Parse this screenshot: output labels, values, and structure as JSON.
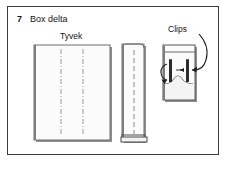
{
  "figure": {
    "step_number": "7",
    "title": "Box delta",
    "labels": {
      "material": "Tyvek",
      "clips": "Clips"
    }
  },
  "colors": {
    "frame_stroke": "#3a3a3a",
    "text": "#141414",
    "panel_fill": "#fbfbfb",
    "panel_stroke": "#6e6e6e",
    "panel_shadow": "#8a8a8a",
    "fold_line": "#9a9a9a",
    "clip_dark": "#2b2b2b",
    "arrow": "#1e1e1e",
    "background": "#ffffff"
  },
  "parts": {
    "flat_panel": {
      "name": "Tyvek sheet flat",
      "fold_lines": 2,
      "fold_style": "dash-dot"
    },
    "folded_strip": {
      "name": "Folded Tyvek strip",
      "fold_lines": 1,
      "fold_style": "dashed",
      "has_bottom_band": true
    },
    "clipped_box": {
      "name": "Box end with clips",
      "clip_count": 2,
      "arrows": 2,
      "has_curved_fold": true
    }
  }
}
